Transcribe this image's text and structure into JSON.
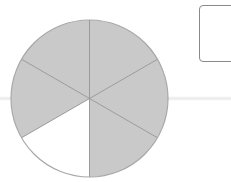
{
  "figure": {
    "type": "fraction-circle",
    "total_parts": 6,
    "shaded_parts": 5,
    "unshaded_parts": 1,
    "unshaded_position": "bottom-left",
    "colors": {
      "shaded": "#c9c9c9",
      "unshaded": "#ffffff",
      "divider": "#9a9a9a",
      "outline": "#a8a8a8"
    }
  },
  "answer_box": {
    "value": ""
  }
}
